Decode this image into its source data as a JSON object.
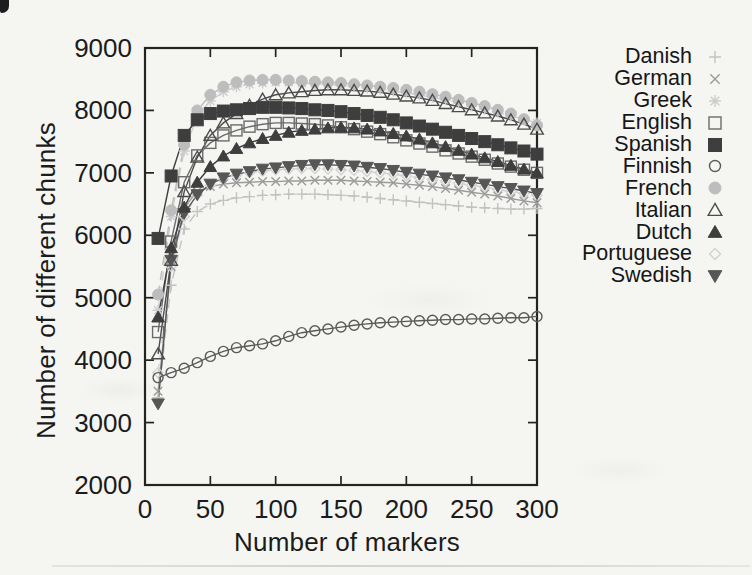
{
  "chart_data": {
    "type": "line",
    "title": "",
    "xlabel": "Number of markers",
    "ylabel": "Number of different chunks",
    "xlim": [
      0,
      300
    ],
    "ylim": [
      2000,
      9000
    ],
    "xticks": [
      0,
      50,
      100,
      150,
      200,
      250,
      300
    ],
    "yticks": [
      2000,
      3000,
      4000,
      5000,
      6000,
      7000,
      8000,
      9000
    ],
    "grid": false,
    "legend_position": "right-outside",
    "x": [
      10,
      20,
      30,
      40,
      50,
      60,
      70,
      80,
      90,
      100,
      110,
      120,
      130,
      140,
      150,
      160,
      170,
      180,
      190,
      200,
      210,
      220,
      230,
      240,
      250,
      260,
      270,
      280,
      290,
      300
    ],
    "series": [
      {
        "name": "Danish",
        "marker": "plus",
        "line": "dashed",
        "color": "#c2c2c2",
        "values": [
          3400,
          5200,
          6100,
          6380,
          6500,
          6560,
          6600,
          6620,
          6640,
          6650,
          6660,
          6660,
          6660,
          6650,
          6640,
          6630,
          6610,
          6590,
          6570,
          6550,
          6530,
          6510,
          6490,
          6470,
          6450,
          6440,
          6430,
          6420,
          6420,
          6430
        ]
      },
      {
        "name": "German",
        "marker": "cross",
        "line": "solid",
        "color": "#9b9b9b",
        "values": [
          3500,
          5500,
          6450,
          6700,
          6780,
          6820,
          6840,
          6850,
          6860,
          6860,
          6870,
          6870,
          6880,
          6880,
          6880,
          6870,
          6860,
          6850,
          6840,
          6820,
          6800,
          6780,
          6750,
          6720,
          6690,
          6660,
          6630,
          6590,
          6550,
          6520
        ]
      },
      {
        "name": "Greek",
        "marker": "asterisk",
        "line": "dashed",
        "color": "#cdcdcd",
        "values": [
          4800,
          6300,
          7350,
          7900,
          8150,
          8300,
          8380,
          8420,
          8440,
          8450,
          8450,
          8440,
          8430,
          8420,
          8400,
          8380,
          8360,
          8340,
          8310,
          8280,
          8250,
          8210,
          8170,
          8120,
          8070,
          8020,
          7970,
          7910,
          7860,
          7800
        ]
      },
      {
        "name": "English",
        "marker": "square-open",
        "line": "solid",
        "color": "#6b6b6b",
        "values": [
          4450,
          5900,
          6850,
          7280,
          7480,
          7600,
          7680,
          7740,
          7780,
          7800,
          7800,
          7790,
          7780,
          7760,
          7730,
          7700,
          7660,
          7620,
          7570,
          7520,
          7470,
          7420,
          7360,
          7310,
          7260,
          7210,
          7150,
          7100,
          7050,
          7000
        ]
      },
      {
        "name": "Spanish",
        "marker": "square-filled",
        "line": "solid",
        "color": "#3e3e3e",
        "values": [
          5950,
          6950,
          7600,
          7850,
          7950,
          7990,
          8010,
          8030,
          8050,
          8050,
          8040,
          8030,
          8010,
          8000,
          7980,
          7950,
          7920,
          7890,
          7850,
          7800,
          7750,
          7700,
          7650,
          7600,
          7550,
          7500,
          7450,
          7400,
          7350,
          7300
        ]
      },
      {
        "name": "Finnish",
        "marker": "circle-open",
        "line": "solid",
        "color": "#5a5a5a",
        "values": [
          3720,
          3800,
          3870,
          3960,
          4060,
          4140,
          4200,
          4230,
          4260,
          4310,
          4380,
          4440,
          4470,
          4500,
          4530,
          4560,
          4580,
          4600,
          4610,
          4620,
          4630,
          4640,
          4650,
          4650,
          4660,
          4660,
          4670,
          4680,
          4680,
          4700
        ]
      },
      {
        "name": "French",
        "marker": "circle-filled",
        "line": "dashed",
        "color": "#bdbdbd",
        "values": [
          5050,
          6400,
          7450,
          8000,
          8250,
          8380,
          8450,
          8480,
          8490,
          8490,
          8480,
          8470,
          8460,
          8450,
          8440,
          8420,
          8400,
          8380,
          8360,
          8330,
          8300,
          8260,
          8220,
          8170,
          8120,
          8070,
          8010,
          7950,
          7860,
          7760
        ]
      },
      {
        "name": "Italian",
        "marker": "triangle-open",
        "line": "solid",
        "color": "#4c4c4c",
        "values": [
          4100,
          5600,
          6700,
          7250,
          7600,
          7800,
          7950,
          8080,
          8180,
          8250,
          8280,
          8300,
          8320,
          8330,
          8330,
          8320,
          8310,
          8290,
          8260,
          8230,
          8200,
          8160,
          8110,
          8060,
          8010,
          7960,
          7910,
          7850,
          7780,
          7700
        ]
      },
      {
        "name": "Dutch",
        "marker": "triangle-filled",
        "line": "solid",
        "color": "#3e3e3e",
        "values": [
          4690,
          5800,
          6450,
          6850,
          7100,
          7270,
          7390,
          7480,
          7550,
          7600,
          7650,
          7680,
          7700,
          7720,
          7730,
          7720,
          7700,
          7670,
          7630,
          7590,
          7540,
          7480,
          7420,
          7360,
          7300,
          7240,
          7180,
          7120,
          7060,
          7000
        ]
      },
      {
        "name": "Portuguese",
        "marker": "diamond-open",
        "line": "dashed",
        "color": "#d2d2d2",
        "values": [
          3800,
          5500,
          6300,
          6650,
          6800,
          6900,
          6960,
          7000,
          7030,
          7050,
          7060,
          7070,
          7070,
          7060,
          7050,
          7040,
          7020,
          7000,
          6980,
          6950,
          6920,
          6890,
          6860,
          6830,
          6800,
          6770,
          6730,
          6700,
          6670,
          6640
        ]
      },
      {
        "name": "Swedish",
        "marker": "triangle-down-filled",
        "line": "solid",
        "color": "#565656",
        "values": [
          3300,
          5600,
          6350,
          6650,
          6820,
          6920,
          6980,
          7020,
          7060,
          7080,
          7100,
          7120,
          7130,
          7130,
          7120,
          7110,
          7090,
          7070,
          7040,
          7010,
          6980,
          6950,
          6920,
          6890,
          6850,
          6820,
          6780,
          6750,
          6710,
          6670
        ]
      }
    ]
  }
}
